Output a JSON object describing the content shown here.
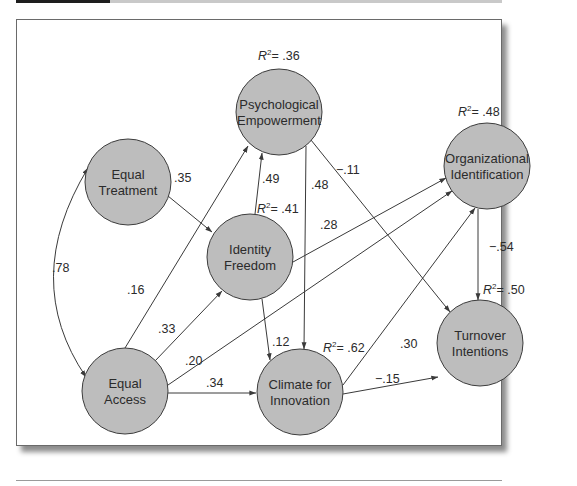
{
  "figure": {
    "type": "path-model",
    "nodes": [
      {
        "id": "PE",
        "line1": "Psychological",
        "line2": "Empowerment",
        "r2": "= .36"
      },
      {
        "id": "ET",
        "line1": "Equal",
        "line2": "Treatment",
        "r2": null
      },
      {
        "id": "IF",
        "line1": "Identity",
        "line2": "Freedom",
        "r2": "= .41"
      },
      {
        "id": "OI",
        "line1": "Organizational",
        "line2": "Identification",
        "r2": "= .48"
      },
      {
        "id": "EA",
        "line1": "Equal",
        "line2": "Access",
        "r2": null
      },
      {
        "id": "CI",
        "line1": "Climate for",
        "line2": "Innovation",
        "r2": "= .62"
      },
      {
        "id": "TI",
        "line1": "Turnover",
        "line2": "Intentions",
        "r2": "= .50"
      }
    ],
    "r2_symbol": "R",
    "r2_sup": "2",
    "edges": [
      {
        "from": "ET",
        "to": "IF",
        "coef": ".35"
      },
      {
        "from": "IF",
        "to": "PE",
        "coef": ".49"
      },
      {
        "from": "EA",
        "to": "PE",
        "coef": ".16"
      },
      {
        "from": "EA",
        "to": "IF",
        "coef": ".33"
      },
      {
        "from": "EA",
        "to": "OI",
        "coef": ".20"
      },
      {
        "from": "EA",
        "to": "CI",
        "coef": ".34"
      },
      {
        "from": "IF",
        "to": "OI",
        "coef": ".28"
      },
      {
        "from": "IF",
        "to": "CI",
        "coef": ".12"
      },
      {
        "from": "PE",
        "to": "CI",
        "coef": ".48"
      },
      {
        "from": "PE",
        "to": "TI",
        "coef": "−.11"
      },
      {
        "from": "CI",
        "to": "OI",
        "coef": ".30"
      },
      {
        "from": "CI",
        "to": "TI",
        "coef": "−.15"
      },
      {
        "from": "OI",
        "to": "TI",
        "coef": "−.54"
      },
      {
        "from": "ET",
        "to": "EA",
        "coef": ".78",
        "bidirectional": true
      }
    ]
  },
  "colors": {
    "node_fill": "#bdbdbd",
    "node_stroke": "#3c3c3c",
    "line": "#3a3a3a",
    "topbar_dark": "#1e1e1e",
    "topbar_light": "#c9c9c9"
  }
}
